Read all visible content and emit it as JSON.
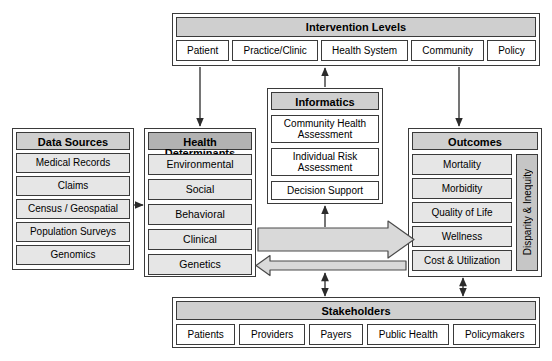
{
  "diagram": {
    "colors": {
      "header_fill": "#cfcfcf",
      "header_fill_dark": "#b2b2b2",
      "item_fill": "#e6e6e6",
      "item_fill_white": "#ffffff",
      "sidebar_fill": "#c6c6c6",
      "stroke": "#3a3a3a",
      "arrow_fill": "#d9d9d9",
      "background": "#ffffff"
    }
  },
  "intervention_levels": {
    "title": "Intervention Levels",
    "items": [
      {
        "label": "Patient"
      },
      {
        "label": "Practice/Clinic"
      },
      {
        "label": "Health System"
      },
      {
        "label": "Community"
      },
      {
        "label": "Policy"
      }
    ]
  },
  "data_sources": {
    "title": "Data Sources",
    "items": [
      {
        "label": "Medical Records"
      },
      {
        "label": "Claims"
      },
      {
        "label": "Census / Geospatial"
      },
      {
        "label": "Population Surveys"
      },
      {
        "label": "Genomics"
      }
    ]
  },
  "health_determinants": {
    "title": "Health Determinants",
    "items": [
      {
        "label": "Environmental"
      },
      {
        "label": "Social"
      },
      {
        "label": "Behavioral"
      },
      {
        "label": "Clinical"
      },
      {
        "label": "Genetics"
      }
    ]
  },
  "informatics": {
    "title": "Informatics",
    "items": [
      {
        "label": "Community Health Assessment"
      },
      {
        "label": "Individual Risk Assessment"
      },
      {
        "label": "Decision Support"
      }
    ]
  },
  "outcomes": {
    "title": "Outcomes",
    "items": [
      {
        "label": "Mortality"
      },
      {
        "label": "Morbidity"
      },
      {
        "label": "Quality of Life"
      },
      {
        "label": "Wellness"
      },
      {
        "label": "Cost & Utilization"
      }
    ],
    "sidebar_label": "Disparity & Inequity"
  },
  "stakeholders": {
    "title": "Stakeholders",
    "items": [
      {
        "label": "Patients"
      },
      {
        "label": "Providers"
      },
      {
        "label": "Payers"
      },
      {
        "label": "Public Health"
      },
      {
        "label": "Policymakers"
      }
    ]
  },
  "connectors": [
    {
      "name": "patient-to-health-determinants",
      "direction": "down"
    },
    {
      "name": "informatics-to-health-system",
      "direction": "up"
    },
    {
      "name": "community-to-outcomes",
      "direction": "down"
    },
    {
      "name": "data-sources-to-health-determinants",
      "direction": "right"
    },
    {
      "name": "determinants-to-outcomes-block-arrow",
      "direction": "right"
    },
    {
      "name": "outcomes-to-determinants-block-arrow",
      "direction": "left"
    },
    {
      "name": "flow-to-informatics",
      "direction": "up"
    },
    {
      "name": "flow-to-stakeholders",
      "direction": "both"
    },
    {
      "name": "outcomes-to-stakeholders",
      "direction": "both"
    }
  ]
}
